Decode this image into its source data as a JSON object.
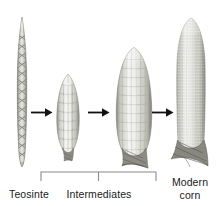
{
  "figure": {
    "background_color": "#ffffff"
  },
  "specimens": [
    {
      "id": "teosinte",
      "name": "teosinte-spike",
      "label": "Teosinte",
      "description": "narrow two-ranked teosinte ear with triangular fruitcases",
      "kernel_rows": 2,
      "relative_length": 1.0,
      "relative_width": 0.12
    },
    {
      "id": "intermediate-small",
      "name": "intermediate-cob-small",
      "label": "",
      "description": "small intermediate cob with few large kernel rows",
      "kernel_rows": 6,
      "relative_length": 0.58,
      "relative_width": 0.35
    },
    {
      "id": "intermediate-large",
      "name": "intermediate-cob-large",
      "label": "",
      "description": "larger intermediate cob with many kernel rows",
      "kernel_rows": 10,
      "relative_length": 0.82,
      "relative_width": 0.55
    },
    {
      "id": "modern-corn",
      "name": "modern-corn-cob",
      "label": "Modern corn",
      "description": "modern maize ear, long and cylindrical with dense fine kernels",
      "kernel_rows": 16,
      "relative_length": 1.04,
      "relative_width": 0.5
    }
  ],
  "arrows": [
    {
      "name": "arrow-teosinte-to-intermediate-1",
      "direction": "right",
      "symbol": "→"
    },
    {
      "name": "arrow-intermediate-1-to-2",
      "direction": "right",
      "symbol": "→"
    },
    {
      "name": "arrow-intermediate-2-to-modern",
      "direction": "right",
      "symbol": "→"
    }
  ],
  "labels": {
    "teosinte": "Teosinte",
    "intermediates": "Intermediates",
    "modern_corn_line1": "Modern",
    "modern_corn_line2": "corn"
  },
  "bracket": {
    "name": "intermediates-bracket",
    "spans_label": "Intermediates",
    "covers": [
      "intermediate-small",
      "intermediate-large"
    ]
  },
  "colors": {
    "background": "#ffffff",
    "kernel_light": "#f2f2f0",
    "kernel_mid": "#d6d6d2",
    "kernel_shadow": "#a9a9a4",
    "outline": "#8e8e88",
    "husk_dark": "#6d6d68",
    "teosinte_dark": "#77776f",
    "text": "#1a1a1a",
    "rule": "#8a8a8a"
  }
}
